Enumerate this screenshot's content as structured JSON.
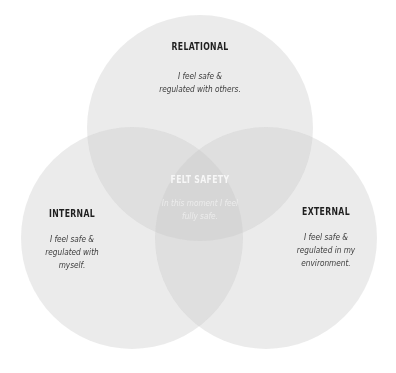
{
  "diagram": {
    "type": "venn",
    "colors": {
      "background": "#ffffff",
      "circle_fill": "#c8c8c8",
      "title_text": "#1f1f1f",
      "desc_text": "#3c3c3c",
      "center_title_text": "#f7f7f7",
      "center_desc_text": "#ececec"
    },
    "circles": [
      {
        "id": "relational",
        "title": "RELATIONAL",
        "desc_line1": "I feel safe &",
        "desc_line2": "regulated with others."
      },
      {
        "id": "internal",
        "title": "INTERNAL",
        "desc_line1": "I feel safe &",
        "desc_line2": "regulated with",
        "desc_line3": "myself."
      },
      {
        "id": "external",
        "title": "EXTERNAL",
        "desc_line1": "I feel safe &",
        "desc_line2": "regulated in my",
        "desc_line3": "environment."
      }
    ],
    "center": {
      "title": "FELT SAFETY",
      "desc_line1": "In this moment I feel",
      "desc_line2": "fully safe."
    }
  }
}
